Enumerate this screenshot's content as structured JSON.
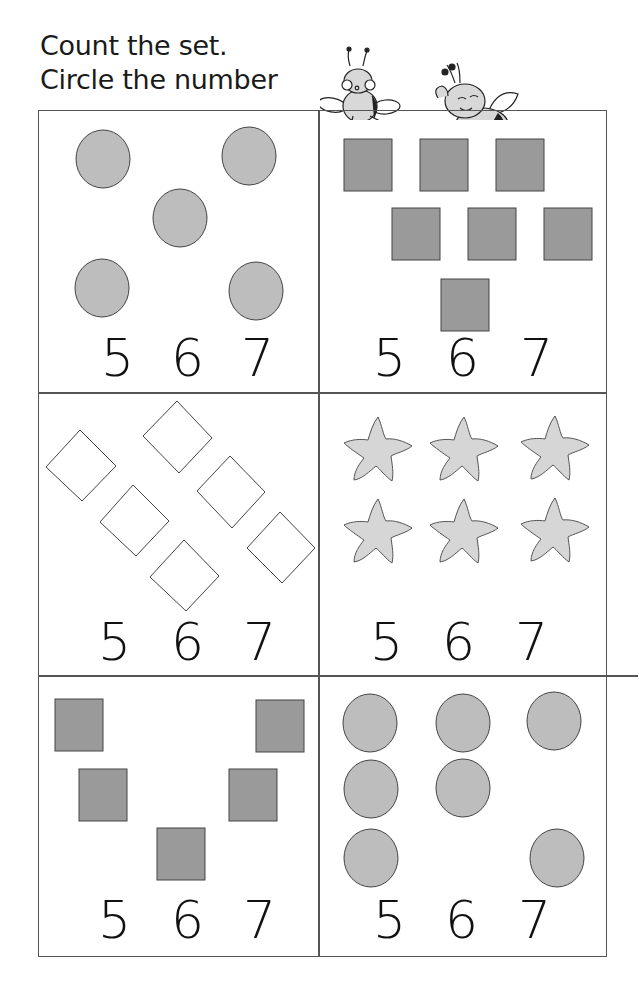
{
  "worksheet": {
    "title_line1": "Count the set.",
    "title_line2": "Circle the number",
    "decoration": "two cartoon bees",
    "colors": {
      "circle_fill": "#bdbdbd",
      "square_fill": "#9a9a9a",
      "star_fill": "#d6d6d6",
      "outline": "#444444",
      "grid_line": "#555555"
    },
    "cells": [
      {
        "shape": "circle",
        "count": 5,
        "choices": [
          "5",
          "6",
          "7"
        ]
      },
      {
        "shape": "square",
        "count": 7,
        "choices": [
          "5",
          "6",
          "7"
        ]
      },
      {
        "shape": "diamond",
        "count": 7,
        "choices": [
          "5",
          "6",
          "7"
        ]
      },
      {
        "shape": "star",
        "count": 6,
        "choices": [
          "5",
          "6",
          "7"
        ]
      },
      {
        "shape": "square",
        "count": 5,
        "choices": [
          "5",
          "6",
          "7"
        ]
      },
      {
        "shape": "circle",
        "count": 7,
        "choices": [
          "5",
          "6",
          "7"
        ]
      }
    ]
  }
}
